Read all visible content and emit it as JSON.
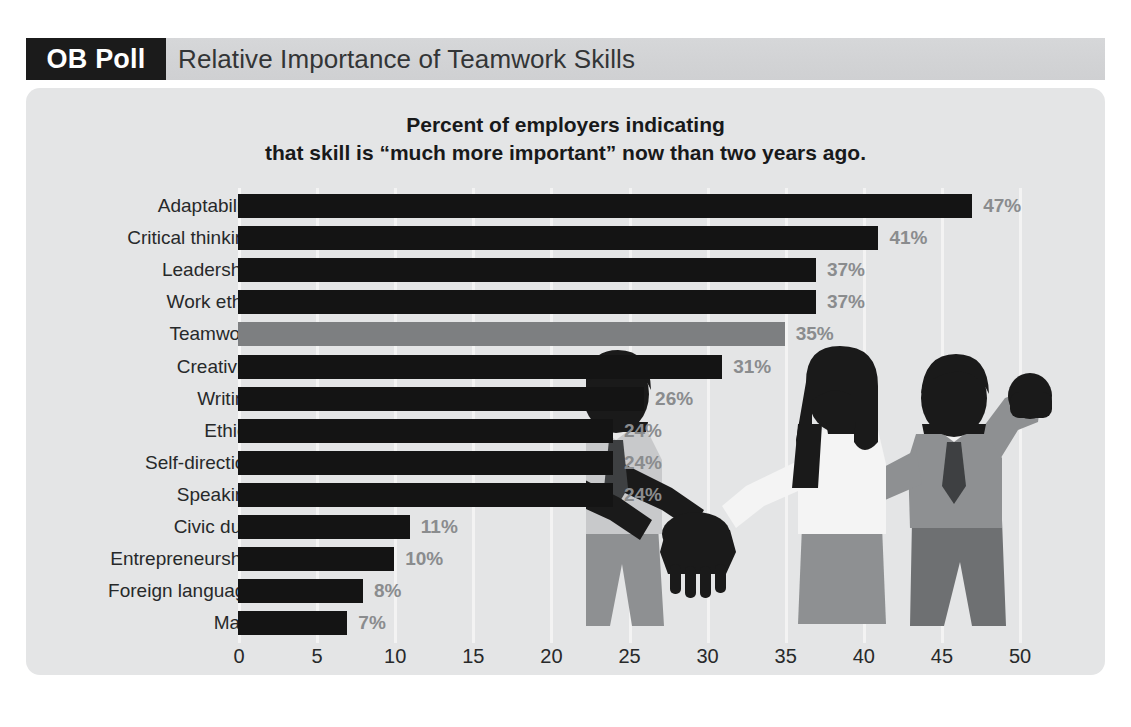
{
  "header": {
    "badge": "OB Poll",
    "title": "Relative Importance of Teamwork Skills"
  },
  "colors": {
    "page_background": "#ffffff",
    "header_band": "#d3d4d6",
    "badge_background": "#1b1b1b",
    "badge_text": "#ffffff",
    "panel_background": "#e4e5e6",
    "bar": "#141414",
    "bar_highlight": "#7d7f81",
    "value_label": "#8a8c8e",
    "axis_text": "#27292a",
    "gridline": "#f3f3f3",
    "illustration_dark": "#1a1a1a",
    "illustration_mid": "#8e9092",
    "illustration_light": "#c8c9cb",
    "illustration_white": "#f4f4f4"
  },
  "chart_data": {
    "type": "bar",
    "orientation": "horizontal",
    "title": "Percent of employers indicating that skill is “much more important” now than two years ago.",
    "title_lines": [
      "Percent of employers indicating",
      "that skill is “much more important” now than two years ago."
    ],
    "xlabel": "",
    "ylabel": "",
    "xlim": [
      0,
      52
    ],
    "xticks": [
      0,
      5,
      10,
      15,
      20,
      25,
      30,
      35,
      40,
      45,
      50
    ],
    "xtick_labels": [
      "0",
      "5",
      "10",
      "15",
      "20",
      "25",
      "30",
      "35",
      "40",
      "45",
      "50"
    ],
    "grid": true,
    "legend": false,
    "highlight_category": "Teamwork",
    "categories": [
      "Adaptability",
      "Critical thinking",
      "Leadership",
      "Work ethic",
      "Teamwork",
      "Creativity",
      "Writing",
      "Ethics",
      "Self-direction",
      "Speaking",
      "Civic duty",
      "Entrepreneurship",
      "Foreign language",
      "Math"
    ],
    "values": [
      47,
      41,
      37,
      37,
      35,
      31,
      26,
      24,
      24,
      24,
      11,
      10,
      8,
      7
    ],
    "value_labels": [
      "47%",
      "41%",
      "37%",
      "37%",
      "35%",
      "31%",
      "26%",
      "24%",
      "24%",
      "24%",
      "11%",
      "10%",
      "8%",
      "7%"
    ],
    "bars": [
      {
        "category": "Adaptability",
        "value": 47,
        "label": "47%",
        "highlight": false
      },
      {
        "category": "Critical thinking",
        "value": 41,
        "label": "41%",
        "highlight": false
      },
      {
        "category": "Leadership",
        "value": 37,
        "label": "37%",
        "highlight": false
      },
      {
        "category": "Work ethic",
        "value": 37,
        "label": "37%",
        "highlight": false
      },
      {
        "category": "Teamwork",
        "value": 35,
        "label": "35%",
        "highlight": true
      },
      {
        "category": "Creativity",
        "value": 31,
        "label": "31%",
        "highlight": false
      },
      {
        "category": "Writing",
        "value": 26,
        "label": "26%",
        "highlight": false
      },
      {
        "category": "Ethics",
        "value": 24,
        "label": "24%",
        "highlight": false
      },
      {
        "category": "Self-direction",
        "value": 24,
        "label": "24%",
        "highlight": false
      },
      {
        "category": "Speaking",
        "value": 24,
        "label": "24%",
        "highlight": false
      },
      {
        "category": "Civic duty",
        "value": 11,
        "label": "11%",
        "highlight": false
      },
      {
        "category": "Entrepreneurship",
        "value": 10,
        "label": "10%",
        "highlight": false
      },
      {
        "category": "Foreign language",
        "value": 8,
        "label": "8%",
        "highlight": false
      },
      {
        "category": "Math",
        "value": 7,
        "label": "7%",
        "highlight": false
      }
    ]
  },
  "illustration": {
    "name": "teamwork-silhouettes",
    "description": "Four silhouetted business people joining hands in the center, one raising a fist"
  }
}
